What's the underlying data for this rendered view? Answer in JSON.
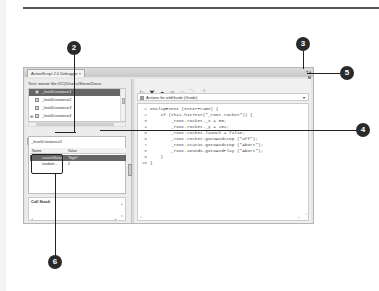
{
  "window": {
    "tab_title": "ActionScript 2.0 Debugger ×",
    "controls": "▾ ▴"
  },
  "left_pane": {
    "movie_label": "Test: movie file:///C|/Users/Steve/Docu",
    "tree_items": [
      {
        "label": "_level0.instance1",
        "selected": true
      },
      {
        "label": "_level0.instance2",
        "selected": false
      },
      {
        "label": "_level0.instance3",
        "selected": false
      },
      {
        "label": "_level0.instance4",
        "selected": false
      }
    ],
    "tabs": [
      {
        "label": "Properties",
        "active": false
      },
      {
        "label": "Variables",
        "active": true
      },
      {
        "label": "Locals",
        "active": false
      },
      {
        "label": "Watch",
        "active": false
      }
    ],
    "instance_label": "_level0.instance2",
    "var_headers": {
      "name": "Name",
      "value": "Value"
    },
    "variables": [
      {
        "name": "currentStatus",
        "value": "\"flight\"",
        "selected": true
      },
      {
        "name": "random...",
        "value": "2",
        "selected": false
      }
    ],
    "callstack_label": "Call Stack"
  },
  "right_pane": {
    "toolbar": [
      {
        "name": "continue",
        "glyph": "▷"
      },
      {
        "name": "stop-debugging",
        "glyph": "✕"
      },
      {
        "name": "toggle-breakpoint",
        "glyph": "●"
      },
      {
        "name": "remove-breakpoints",
        "glyph": "■"
      },
      {
        "name": "step-over",
        "glyph": "⤼"
      },
      {
        "name": "step-in",
        "glyph": "⤵"
      },
      {
        "name": "step-out",
        "glyph": "⤴"
      }
    ],
    "actions_label": "Actions for wfdGuide (Guide)",
    "dropdown_glyph": "▾",
    "code_lines": [
      {
        "n": "1",
        "text": "onClipEvent (enterFrame) {"
      },
      {
        "n": "2",
        "text": "    if (this.hitTest(\"_root.rocket\")) {"
      },
      {
        "n": "3",
        "text": "        _root.rocket._x = 88;"
      },
      {
        "n": "4",
        "text": "        _root.rocket._y = 282;"
      },
      {
        "n": "5",
        "text": "        _root.rocket.launch = false;"
      },
      {
        "n": "6",
        "text": "        _root.rocket.gotoAndStop (\"off\");"
      },
      {
        "n": "7",
        "text": "        _root.status.gotoAndStop (\"Abort\");"
      },
      {
        "n": "8",
        "text": "        _root.sounds.gotoAndPlay (\"Abort\");"
      },
      {
        "n": "9",
        "text": "    }"
      },
      {
        "n": "10",
        "text": "}"
      }
    ]
  },
  "callouts": [
    "2",
    "3",
    "4",
    "5",
    "6"
  ],
  "colors": {
    "callout_bg": "#2a2a2a",
    "selection": "#666666",
    "window_bg": "#e6e6e6"
  }
}
